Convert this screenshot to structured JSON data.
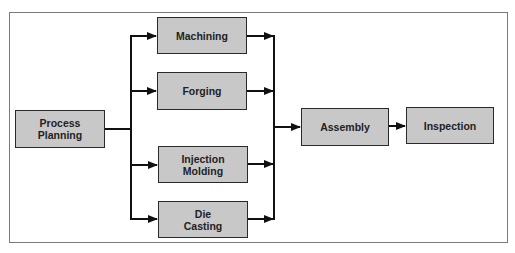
{
  "diagram": {
    "type": "flowchart",
    "colors": {
      "node_fill": "#c8c8c8",
      "node_border": "#2a2a2a",
      "edge": "#111111",
      "frame": "#7a7a7a"
    },
    "nodes": [
      {
        "id": "process_planning",
        "label": "Process\nPlanning"
      },
      {
        "id": "machining",
        "label": "Machining"
      },
      {
        "id": "forging",
        "label": "Forging"
      },
      {
        "id": "injection_molding",
        "label": "Injection\nMolding"
      },
      {
        "id": "die_casting",
        "label": "Die\nCasting"
      },
      {
        "id": "assembly",
        "label": "Assembly"
      },
      {
        "id": "inspection",
        "label": "Inspection"
      }
    ],
    "edges": [
      {
        "from": "process_planning",
        "to": "machining"
      },
      {
        "from": "process_planning",
        "to": "forging"
      },
      {
        "from": "process_planning",
        "to": "injection_molding"
      },
      {
        "from": "process_planning",
        "to": "die_casting"
      },
      {
        "from": "machining",
        "to": "assembly"
      },
      {
        "from": "forging",
        "to": "assembly"
      },
      {
        "from": "injection_molding",
        "to": "assembly"
      },
      {
        "from": "die_casting",
        "to": "assembly"
      },
      {
        "from": "assembly",
        "to": "inspection"
      }
    ]
  }
}
